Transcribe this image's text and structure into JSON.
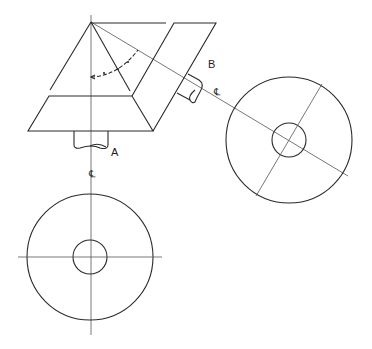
{
  "diagram": {
    "type": "orthographic-projection",
    "labels": {
      "point_a": "A",
      "point_b": "B",
      "centerline_vertical": "℄",
      "centerline_inclined": "℄"
    },
    "views": [
      {
        "name": "front-view-truncated-pyramid-with-inclined-prism"
      },
      {
        "name": "auxiliary-view-inclined",
        "outer_radius": 63,
        "inner_radius": 17
      },
      {
        "name": "bottom-view-circle",
        "outer_radius": 63,
        "inner_radius": 17
      }
    ]
  }
}
